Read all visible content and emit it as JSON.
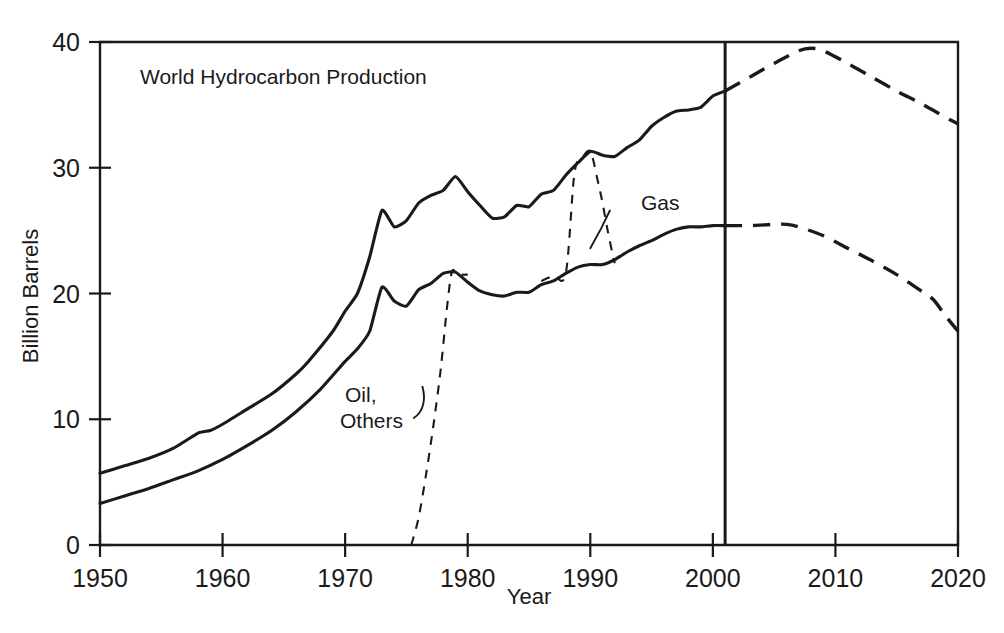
{
  "chart_data": {
    "type": "line",
    "title": "World Hydrocarbon Production",
    "xlabel": "Year",
    "ylabel": "Billion Barrels",
    "xlim": [
      1950,
      2020
    ],
    "ylim": [
      0,
      40
    ],
    "grid": false,
    "legend_position": "inline-annotations",
    "x_ticks": [
      "1950",
      "1960",
      "1970",
      "1980",
      "1990",
      "2000",
      "2010",
      "2020"
    ],
    "y_ticks": [
      "0",
      "10",
      "20",
      "30",
      "40"
    ],
    "annotations": [
      {
        "text": "Gas",
        "x": 1991,
        "y": 27.0
      },
      {
        "text": "Oil,",
        "x": 1974,
        "y": 11.8
      },
      {
        "text": "Others",
        "x": 1974,
        "y": 10.2
      }
    ],
    "markers": [
      {
        "name": "present-year-divider",
        "x": 2001,
        "label": ""
      }
    ],
    "series": [
      {
        "name": "Total hydrocarbon (historic)",
        "style": "solid",
        "x": [
          1950,
          1952,
          1954,
          1956,
          1958,
          1959,
          1960,
          1962,
          1964,
          1966,
          1967,
          1969,
          1970,
          1971,
          1972,
          1973,
          1974,
          1975,
          1976,
          1977,
          1978,
          1979,
          1980,
          1981,
          1982,
          1983,
          1984,
          1985,
          1986,
          1987,
          1988,
          1989,
          1990,
          1991,
          1992,
          1993,
          1994,
          1995,
          1996,
          1997,
          1998,
          1999,
          2000,
          2001
        ],
        "y": [
          5.7,
          6.3,
          6.9,
          7.7,
          8.9,
          9.1,
          9.6,
          10.8,
          12.0,
          13.6,
          14.6,
          17.0,
          18.6,
          20.0,
          22.9,
          26.6,
          25.3,
          25.8,
          27.2,
          27.8,
          28.2,
          29.3,
          28.1,
          27.0,
          26.0,
          26.1,
          27.0,
          26.9,
          27.9,
          28.2,
          29.4,
          30.4,
          31.3,
          31.0,
          30.9,
          31.6,
          32.2,
          33.3,
          34.0,
          34.5,
          34.6,
          34.8,
          35.7,
          36.1
        ]
      },
      {
        "name": "Oil (historic)",
        "style": "solid",
        "x": [
          1950,
          1952,
          1954,
          1956,
          1958,
          1960,
          1962,
          1964,
          1966,
          1968,
          1970,
          1971,
          1972,
          1973,
          1974,
          1975,
          1976,
          1977,
          1978,
          1979,
          1980,
          1981,
          1982,
          1983,
          1984,
          1985,
          1986,
          1987,
          1988,
          1989,
          1990,
          1991,
          1992,
          1993,
          1994,
          1995,
          1996,
          1997,
          1998,
          1999,
          2000,
          2001
        ],
        "y": [
          3.3,
          3.9,
          4.5,
          5.2,
          5.9,
          6.8,
          7.9,
          9.1,
          10.6,
          12.4,
          14.6,
          15.6,
          17.0,
          20.5,
          19.4,
          19.0,
          20.3,
          20.8,
          21.6,
          21.7,
          20.9,
          20.2,
          19.9,
          19.8,
          20.1,
          20.1,
          20.7,
          21.0,
          21.6,
          22.1,
          22.3,
          22.3,
          22.7,
          23.3,
          23.8,
          24.2,
          24.7,
          25.1,
          25.3,
          25.3,
          25.4,
          25.4
        ]
      },
      {
        "name": "Gas share split (dashed separator)",
        "style": "dashed-thin",
        "x": [
          1986,
          1987,
          1988,
          1988.7,
          1989.3,
          1990,
          1990.6,
          1991,
          1991.4,
          1991.8,
          1992
        ],
        "y": [
          21.0,
          21.4,
          21.6,
          29.5,
          30.7,
          31.3,
          29.0,
          27.2,
          25.1,
          23.2,
          22.4
        ]
      },
      {
        "name": "Oil Others share split (dashed separator)",
        "style": "dashed-thin",
        "x": [
          1975.4,
          1976.0,
          1976.6,
          1977.2,
          1977.8,
          1978.3,
          1978.7,
          1979.1,
          1979.5,
          1980.0
        ],
        "y": [
          0.0,
          2.2,
          5.6,
          9.5,
          14.0,
          18.8,
          21.7,
          21.6,
          21.5,
          21.5
        ]
      },
      {
        "name": "Total hydrocarbon (projection)",
        "style": "dashed-thick",
        "x": [
          2001,
          2003,
          2005,
          2007,
          2008,
          2009,
          2011,
          2013,
          2015,
          2017,
          2019,
          2020
        ],
        "y": [
          36.1,
          37.2,
          38.3,
          39.3,
          39.5,
          39.3,
          38.3,
          37.2,
          36.1,
          35.1,
          34.0,
          33.5
        ]
      },
      {
        "name": "Oil (projection)",
        "style": "dashed-thick",
        "x": [
          2001,
          2003,
          2005,
          2006,
          2007,
          2009,
          2011,
          2013,
          2015,
          2017,
          2018,
          2019,
          2020
        ],
        "y": [
          25.4,
          25.4,
          25.5,
          25.5,
          25.3,
          24.6,
          23.6,
          22.6,
          21.5,
          20.2,
          19.5,
          18.2,
          17.0
        ]
      }
    ]
  }
}
